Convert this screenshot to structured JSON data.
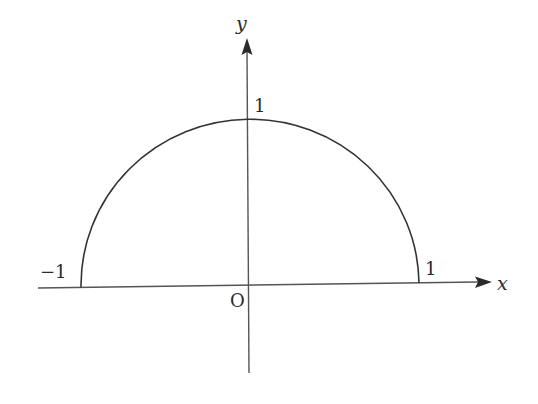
{
  "diagram": {
    "axes": {
      "x_label": "x",
      "y_label": "y",
      "origin_label": "O"
    },
    "tick_labels": {
      "x_negative": "−1",
      "x_positive": "1",
      "y_positive": "1"
    },
    "curve": {
      "type": "semicircle",
      "center": [
        0,
        0
      ],
      "radius": 1,
      "from": [
        -1,
        0
      ],
      "to": [
        1,
        0
      ]
    },
    "colors": {
      "stroke": "#333333",
      "axis": "#555555",
      "text": "#2a2a2a",
      "background": "#ffffff"
    }
  }
}
